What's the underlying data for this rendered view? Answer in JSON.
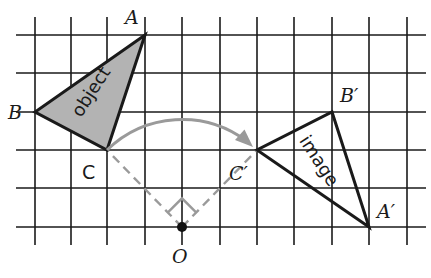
{
  "diagram": {
    "type": "rotation",
    "grid": {
      "x_lines": [
        35,
        71,
        107,
        145,
        182,
        220,
        257,
        294,
        332,
        369,
        407
      ],
      "y_lines": [
        35,
        73,
        112,
        150,
        188,
        227
      ],
      "x_extent": [
        16,
        426
      ],
      "y_extent": [
        17,
        245
      ],
      "color": "#1a1a1a"
    },
    "points": {
      "A": {
        "label": "A",
        "x": 145,
        "y": 35
      },
      "B": {
        "label": "B",
        "x": 35,
        "y": 112
      },
      "C": {
        "label": "C",
        "x": 107,
        "y": 150
      },
      "O": {
        "label": "O",
        "x": 182,
        "y": 227
      },
      "A_prime": {
        "label": "A′",
        "x": 369,
        "y": 227
      },
      "B_prime": {
        "label": "B′",
        "x": 332,
        "y": 112
      },
      "C_prime": {
        "label": "C′",
        "x": 257,
        "y": 150
      }
    },
    "object": {
      "text": "object",
      "fill": "#b3b3b3",
      "stroke": "#1a1a1a"
    },
    "image": {
      "text": "image",
      "fill": "#ffffff",
      "stroke": "#1a1a1a"
    },
    "construction": {
      "color": "#9a9a9a",
      "right_angle_marker": true
    },
    "arc_arrow": {
      "color": "#9a9a9a"
    }
  }
}
